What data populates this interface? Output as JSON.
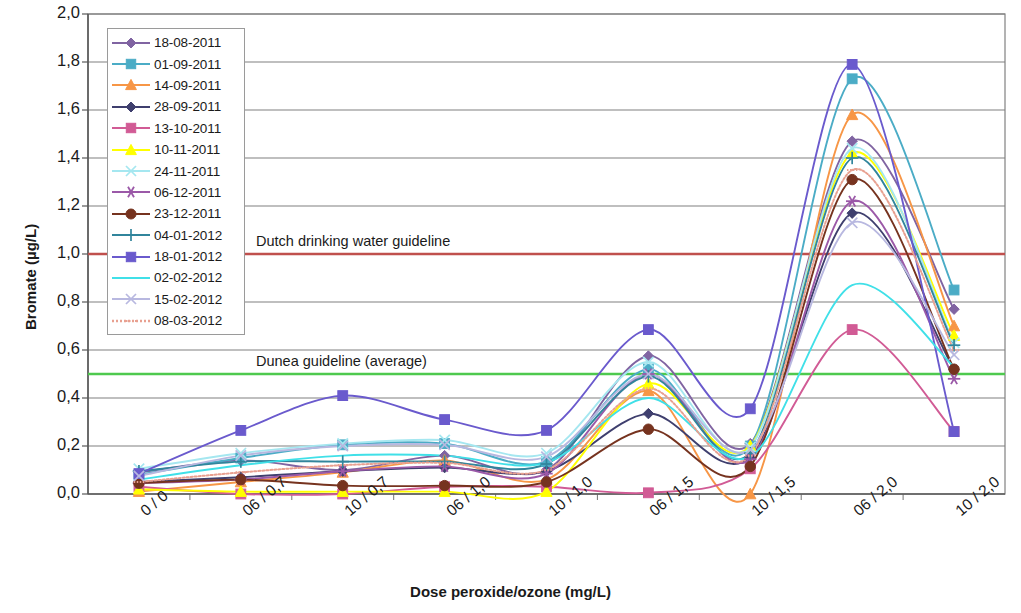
{
  "chart_data": {
    "type": "line",
    "title": "",
    "xlabel": "Dose peroxide/ozone (mg/L)",
    "ylabel": "Bromate (µg/L)",
    "categories": [
      "0 / 0",
      "06 / 0,7",
      "10 / 0,7",
      "06 / 1,0",
      "10 / 1,0",
      "06 / 1,5",
      "10 / 1,5",
      "06 / 2,0",
      "10 / 2,0"
    ],
    "ylim": [
      0.0,
      2.0
    ],
    "yticks": [
      "0,0",
      "0,2",
      "0,4",
      "0,6",
      "0,8",
      "1,0",
      "1,2",
      "1,4",
      "1,6",
      "1,8",
      "2,0"
    ],
    "ytick_values": [
      0.0,
      0.2,
      0.4,
      0.6,
      0.8,
      1.0,
      1.2,
      1.4,
      1.6,
      1.8,
      2.0
    ],
    "grid": true,
    "legend_position": "top-left",
    "smoothed": true,
    "series": [
      {
        "name": "18-08-2011",
        "color": "#8064a2",
        "marker": "diamond",
        "values": [
          0.09,
          0.14,
          0.1,
          0.16,
          0.1,
          0.575,
          0.21,
          1.47,
          0.77
        ]
      },
      {
        "name": "01-09-2011",
        "color": "#4bacc6",
        "marker": "square",
        "values": [
          0.08,
          0.15,
          0.205,
          0.21,
          0.135,
          0.52,
          0.2,
          1.73,
          0.85
        ]
      },
      {
        "name": "14-09-2011",
        "color": "#f79646",
        "marker": "triangle",
        "values": [
          0.01,
          0.05,
          0.09,
          0.14,
          0.06,
          0.43,
          0.0,
          1.58,
          0.7
        ]
      },
      {
        "name": "28-09-2011",
        "color": "#3f3f6e",
        "marker": "diamond",
        "values": [
          0.05,
          0.07,
          0.095,
          0.11,
          0.095,
          0.335,
          0.155,
          1.17,
          0.52
        ]
      },
      {
        "name": "13-10-2011",
        "color": "#d15b95",
        "marker": "square",
        "values": [
          0.03,
          0.0,
          0.0,
          0.03,
          0.03,
          0.005,
          0.105,
          0.685,
          0.26
        ]
      },
      {
        "name": "10-11-2011",
        "color": "#ffff00",
        "marker": "triangle",
        "values": [
          0.02,
          0.01,
          0.01,
          0.01,
          0.01,
          0.46,
          0.2,
          1.42,
          0.66
        ]
      },
      {
        "name": "24-11-2011",
        "color": "#a5e7f0",
        "marker": "x",
        "values": [
          0.105,
          0.17,
          0.21,
          0.225,
          0.17,
          0.55,
          0.195,
          1.44,
          0.63
        ]
      },
      {
        "name": "06-12-2011",
        "color": "#9b59a8",
        "marker": "asterisk",
        "values": [
          0.045,
          0.06,
          0.095,
          0.115,
          0.085,
          0.5,
          0.145,
          1.22,
          0.48
        ]
      },
      {
        "name": "23-12-2011",
        "color": "#76331f",
        "marker": "circle",
        "values": [
          0.045,
          0.06,
          0.035,
          0.035,
          0.05,
          0.27,
          0.115,
          1.31,
          0.52
        ]
      },
      {
        "name": "04-01-2012",
        "color": "#31859c",
        "marker": "plus",
        "values": [
          0.095,
          0.135,
          0.135,
          0.135,
          0.125,
          0.49,
          0.17,
          1.4,
          0.62
        ]
      },
      {
        "name": "18-01-2012",
        "color": "#6a5acd",
        "marker": "square",
        "values": [
          0.085,
          0.265,
          0.41,
          0.31,
          0.265,
          0.685,
          0.355,
          1.79,
          0.26
        ]
      },
      {
        "name": "02-02-2012",
        "color": "#40e0e8",
        "marker": "line",
        "values": [
          0.06,
          0.12,
          0.16,
          0.16,
          0.13,
          0.4,
          0.155,
          0.87,
          0.53
        ]
      },
      {
        "name": "15-02-2012",
        "color": "#b8b8e0",
        "marker": "x",
        "values": [
          0.075,
          0.16,
          0.2,
          0.205,
          0.155,
          0.5,
          0.185,
          1.13,
          0.58
        ]
      },
      {
        "name": "08-03-2012",
        "color": "#e8a090",
        "marker": "dotted",
        "values": [
          0.05,
          0.09,
          0.12,
          0.13,
          0.1,
          0.44,
          0.16,
          1.35,
          0.6
        ]
      }
    ],
    "reference_lines": [
      {
        "label": "Dutch drinking water guideline",
        "value": 1.0,
        "color": "#c0504d"
      },
      {
        "label": "Dunea guideline (average)",
        "value": 0.5,
        "color": "#4ec94e"
      }
    ]
  }
}
